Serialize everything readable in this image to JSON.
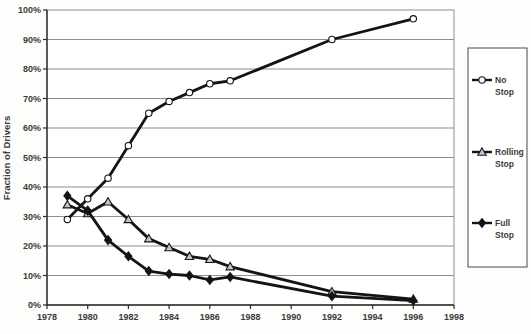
{
  "page": {
    "background": "#fdfdfc"
  },
  "chart_data": {
    "type": "line",
    "title": "",
    "xlabel": "",
    "ylabel": "Fraction of Drivers",
    "x": [
      1979,
      1980,
      1981,
      1982,
      1983,
      1984,
      1985,
      1986,
      1987,
      1992,
      1996
    ],
    "series": [
      {
        "name": "No Stop",
        "label_lines": [
          "No",
          "Stop"
        ],
        "marker": "circle",
        "marker_fill": "#ffffff",
        "values": [
          29,
          36,
          43,
          54,
          65,
          69,
          72,
          75,
          76,
          90,
          97
        ]
      },
      {
        "name": "Rolling Stop",
        "label_lines": [
          "Rolling",
          "Stop"
        ],
        "marker": "triangle",
        "marker_fill": "#c4c4c4",
        "values": [
          34,
          31,
          35,
          29,
          22.5,
          19.5,
          16.5,
          15.5,
          13,
          4.5,
          2
        ]
      },
      {
        "name": "Full Stop",
        "label_lines": [
          "Full",
          "Stop"
        ],
        "marker": "diamond",
        "marker_fill": "#141414",
        "values": [
          37,
          32,
          22,
          16.5,
          11.5,
          10.5,
          10,
          8.5,
          9.5,
          3,
          1.5
        ]
      }
    ],
    "xlim": [
      1978,
      1998
    ],
    "ylim": [
      0,
      100
    ],
    "x_tick_values": [
      1978,
      1980,
      1982,
      1984,
      1986,
      1988,
      1990,
      1992,
      1994,
      1996,
      1998
    ],
    "x_tick_labels": [
      "1978",
      "1980",
      "1982",
      "1984",
      "1986",
      "1988",
      "1990",
      "1992",
      "1994",
      "1996",
      "1998"
    ],
    "y_tick_values": [
      0,
      10,
      20,
      30,
      40,
      50,
      60,
      70,
      80,
      90,
      100
    ],
    "y_tick_labels": [
      "0%",
      "10%",
      "20%",
      "30%",
      "40%",
      "50%",
      "60%",
      "70%",
      "80%",
      "90%",
      "100%"
    ],
    "grid": "horizontal",
    "legend_position": "right-outside",
    "line_color": "#141414",
    "grid_color": "#8e8e8e",
    "axis_color": "#2b2b2b",
    "text_color": "#3b3b3b",
    "legend_border_color": "#4a4a4a",
    "plot_background": "#ffffff"
  }
}
